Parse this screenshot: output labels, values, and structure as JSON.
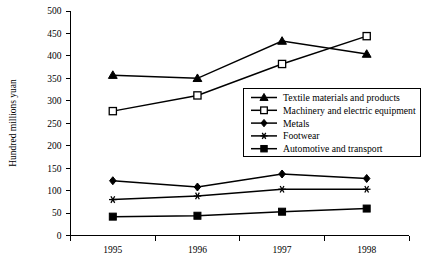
{
  "chart_data": {
    "type": "line",
    "title": "",
    "xlabel": "",
    "ylabel": "Hundred millions yuan",
    "categories": [
      "1995",
      "1996",
      "1997",
      "1998"
    ],
    "ylim": [
      0,
      500
    ],
    "ytick_step": 50,
    "yticks": [
      "0",
      "50",
      "100",
      "150",
      "200",
      "250",
      "300",
      "350",
      "400",
      "450",
      "500"
    ],
    "grid": false,
    "legend_position": "center-right-inside",
    "series": [
      {
        "name": "Textile materials and products",
        "marker": "filled-triangle",
        "values": [
          357,
          350,
          433,
          404
        ]
      },
      {
        "name": "Machinery and electric equipment",
        "marker": "open-square",
        "values": [
          277,
          312,
          382,
          444
        ]
      },
      {
        "name": "Metals",
        "marker": "filled-diamond",
        "values": [
          122,
          108,
          137,
          127
        ]
      },
      {
        "name": "Footwear",
        "marker": "asterisk",
        "values": [
          80,
          88,
          103,
          103
        ]
      },
      {
        "name": "Automotive and transport",
        "marker": "filled-square",
        "values": [
          42,
          44,
          53,
          60
        ]
      }
    ]
  },
  "colors": {
    "ink": "#000000",
    "background": "#ffffff"
  }
}
